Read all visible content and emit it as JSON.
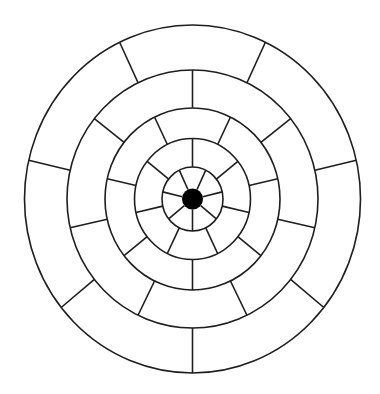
{
  "diagram": {
    "type": "concentric-ring-wheel",
    "center": {
      "x": 192.5,
      "y": 199
    },
    "hub": {
      "rx": 10.5,
      "ry": 10.5,
      "color": "#000000"
    },
    "circles": [
      {
        "rx": 30.5,
        "ry": 32
      },
      {
        "rx": 58,
        "ry": 60.5
      },
      {
        "rx": 87.5,
        "ry": 91
      },
      {
        "rx": 125.5,
        "ry": 129
      },
      {
        "rx": 168,
        "ry": 174
      }
    ],
    "bands": [
      {
        "inner": "hub",
        "outer": 0,
        "spokes": 7,
        "start_angle_deg": 90
      },
      {
        "inner": 0,
        "outer": 1,
        "spokes": 7,
        "start_angle_deg": -90
      },
      {
        "inner": 1,
        "outer": 2,
        "spokes": 7,
        "start_angle_deg": 90
      },
      {
        "inner": 2,
        "outer": 3,
        "spokes": 7,
        "start_angle_deg": -90
      },
      {
        "inner": 3,
        "outer": 4,
        "spokes": 7,
        "start_angle_deg": 90
      }
    ],
    "line_color": "#1e1e1e",
    "background": "#ffffff"
  }
}
